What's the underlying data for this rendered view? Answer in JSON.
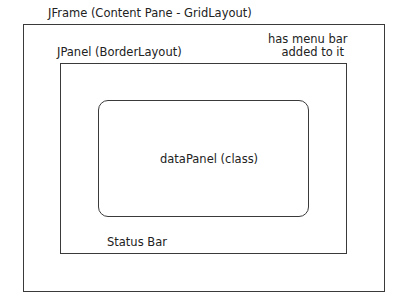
{
  "diagram": {
    "frame": {
      "label": "JFrame (Content Pane - GridLayout)"
    },
    "menu_note": {
      "line1": "has menu bar",
      "line2": "added to it"
    },
    "panel": {
      "label": "JPanel (BorderLayout)"
    },
    "data_panel": {
      "label": "dataPanel (class)"
    },
    "status_bar": {
      "label": "Status Bar"
    }
  }
}
